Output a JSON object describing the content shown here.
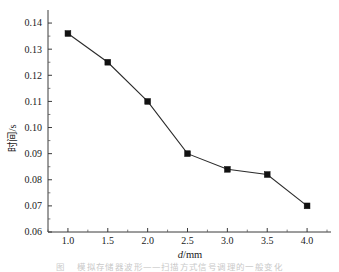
{
  "chart_data": {
    "type": "line",
    "title": "",
    "subtitle": "",
    "xlabel": "d/mm",
    "xlabel_italic_part": "d",
    "xlabel_rest": "/mm",
    "ylabel": "时间/s",
    "ylabel_cjk": "时间",
    "ylabel_unit": "/s",
    "x": [
      1.0,
      1.5,
      2.0,
      2.5,
      3.0,
      3.5,
      4.0
    ],
    "values": [
      0.136,
      0.125,
      0.11,
      0.09,
      0.084,
      0.082,
      0.07
    ],
    "series": [
      {
        "name": "时间",
        "values": [
          0.136,
          0.125,
          0.11,
          0.09,
          0.084,
          0.082,
          0.07
        ]
      }
    ],
    "xlim": [
      0.75,
      4.3
    ],
    "ylim": [
      0.06,
      0.145
    ],
    "xticks": [
      1.0,
      1.5,
      2.0,
      2.5,
      3.0,
      3.5,
      4.0
    ],
    "xtick_labels": [
      "1.0",
      "1.5",
      "2.0",
      "2.5",
      "3.0",
      "3.5",
      "4.0"
    ],
    "x_minor_step": 0.25,
    "yticks": [
      0.06,
      0.07,
      0.08,
      0.09,
      0.1,
      0.11,
      0.12,
      0.13,
      0.14
    ],
    "ytick_labels": [
      "0.06",
      "0.07",
      "0.08",
      "0.09",
      "0.10",
      "0.11",
      "0.12",
      "0.13",
      "0.14"
    ],
    "y_minor_step": 0.005,
    "grid": false,
    "legend": false,
    "legend_position": "none",
    "marker": "square",
    "marker_color": "#111111",
    "line_color": "#2b2b2b",
    "spines": [
      "left",
      "bottom"
    ],
    "tick_direction": "in",
    "annotations": []
  },
  "caption": {
    "number": "图",
    "text": "模拟存储器波形——扫描方式信号调理的一般变化"
  },
  "colors": {
    "background": "#ffffff",
    "axis": "#3a3a3a",
    "data": "#111111",
    "caption": "#c9c9c9"
  }
}
